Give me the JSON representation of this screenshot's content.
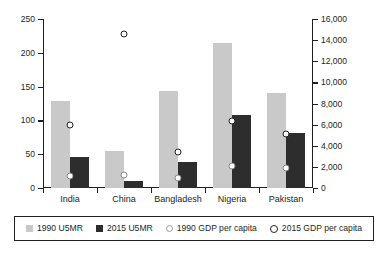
{
  "chart_data": {
    "type": "bar",
    "title": "",
    "subtitle": "",
    "xlabel": "",
    "ylabel": "",
    "categories": [
      "India",
      "China",
      "Bangladesh",
      "Nigeria",
      "Pakistan"
    ],
    "left_axis": {
      "label": "U5MR (deaths per 1,000 live births)",
      "ylim": [
        0,
        250
      ],
      "ticks": [
        0,
        50,
        100,
        150,
        200,
        250
      ],
      "tick_labels": [
        "0",
        "50",
        "100",
        "150",
        "200",
        "250"
      ]
    },
    "right_axis": {
      "label": "GDP per capita",
      "ylim": [
        0,
        16000
      ],
      "ticks": [
        0,
        2000,
        4000,
        6000,
        8000,
        10000,
        12000,
        14000,
        16000
      ],
      "tick_labels": [
        "0",
        "2,000",
        "4,000",
        "6,000",
        "8,000",
        "10,000",
        "12,000",
        "14,000",
        "16,000"
      ]
    },
    "grid": false,
    "legend_position": "bottom",
    "series": [
      {
        "name": "1990 U5MR",
        "kind": "bar",
        "axis": "left",
        "color": "#c9c9c9",
        "values": [
          128,
          55,
          144,
          214,
          140
        ]
      },
      {
        "name": "2015 U5MR",
        "kind": "bar",
        "axis": "left",
        "color": "#2d2d2d",
        "values": [
          46,
          11,
          38,
          108,
          81
        ]
      },
      {
        "name": "1990 GDP per capita",
        "kind": "marker",
        "axis": "right",
        "color": "#ffffff",
        "values": [
          1100,
          1200,
          950,
          2100,
          1900
        ]
      },
      {
        "name": "2015 GDP per capita",
        "kind": "marker",
        "axis": "right",
        "color": "#ffffff",
        "values": [
          6000,
          14600,
          3400,
          6300,
          5100
        ]
      }
    ]
  },
  "legend": {
    "items": [
      {
        "label": "1990 U5MR",
        "icon": "square-light-swatch"
      },
      {
        "label": "2015 U5MR",
        "icon": "square-dark-swatch"
      },
      {
        "label": "1990 GDP per capita",
        "icon": "circle-open-light-marker"
      },
      {
        "label": "2015 GDP per capita",
        "icon": "circle-open-dark-marker"
      }
    ]
  }
}
